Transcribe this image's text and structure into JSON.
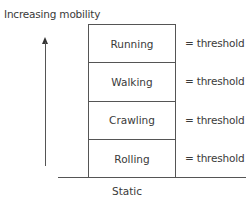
{
  "axis": {
    "label": "Increasing mobility",
    "arrow_icon": "up-arrow"
  },
  "levels": [
    {
      "label": "Running",
      "threshold": "= threshold"
    },
    {
      "label": "Walking",
      "threshold": "= threshold"
    },
    {
      "label": "Crawling",
      "threshold": "= threshold"
    },
    {
      "label": "Rolling",
      "threshold": "= threshold"
    }
  ],
  "baseline": {
    "label": "Static"
  }
}
